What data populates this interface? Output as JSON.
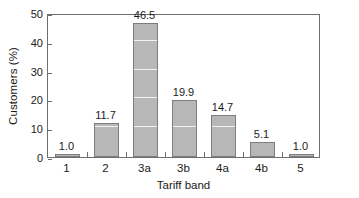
{
  "chart_data": {
    "type": "bar",
    "title": "",
    "xlabel": "Tariff band",
    "ylabel": "Customers (%)",
    "categories": [
      "1",
      "2",
      "3a",
      "3b",
      "4a",
      "4b",
      "5"
    ],
    "values": [
      1.0,
      11.7,
      46.5,
      19.9,
      14.7,
      5.1,
      1.0
    ],
    "value_labels": [
      "1.0",
      "11.7",
      "46.5",
      "19.9",
      "14.7",
      "5.1",
      "1.0"
    ],
    "ylim": [
      0,
      50
    ],
    "yticks": [
      0,
      10,
      20,
      30,
      40,
      50
    ],
    "ytick_labels": [
      "0",
      "10",
      "20",
      "30",
      "40",
      "50"
    ],
    "grid": "horizontal-white-over-bars",
    "legend": "none",
    "bar_color": "#b7b7b7",
    "bar_edge_color": "#7d7d7d",
    "axis_color": "#6e6e6e",
    "gridline_color": "#f2f2f2",
    "background": "#ffffff"
  }
}
